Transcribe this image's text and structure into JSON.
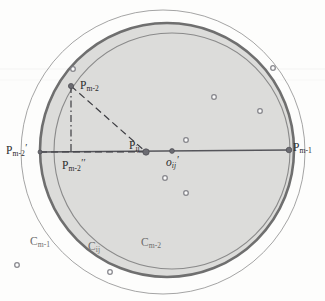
{
  "figure": {
    "background_color": "#fdfdfc",
    "shade_color": "#dcdcda",
    "line_color": "#8a8a8a",
    "thick_line_color": "#6f6f6f",
    "dot_color": "#7e7e84",
    "text_color": "#2b2b2b"
  },
  "labels": {
    "p_m2_top": {
      "base": "P",
      "sub": "m-2",
      "prime": ""
    },
    "p_m2_left": {
      "base": "P",
      "sub": "m-2",
      "prime": "′"
    },
    "p_m2_foot": {
      "base": "P",
      "sub": "m-2",
      "prime": "′′"
    },
    "p_ij": {
      "base": "P",
      "sub": "ij",
      "prime": ""
    },
    "p_m1_right": {
      "base": "P",
      "sub": "m-1",
      "prime": ""
    },
    "o_ij": {
      "base": "o",
      "sub": "ij",
      "prime": "′"
    },
    "c_m1": {
      "base": "C",
      "sub": "m-1",
      "prime": ""
    },
    "c_ij": {
      "base": "C",
      "sub": "ij",
      "prime": ""
    },
    "c_m2": {
      "base": "C",
      "sub": "m-2",
      "prime": ""
    }
  },
  "chart_data": {
    "type": "scatter",
    "xlabel": "",
    "ylabel": "",
    "xlim": [
      0,
      325
    ],
    "ylim": [
      0,
      301
    ],
    "grid": false,
    "legend_position": "none",
    "circles": [
      {
        "name": "C_m-1",
        "cx": 163,
        "cy": 152,
        "r": 142,
        "stroke": "#9a9a9a",
        "stroke_width": 0.9,
        "fill": "none"
      },
      {
        "name": "C_ij",
        "cx": 167,
        "cy": 150,
        "r": 127,
        "stroke": "#6f6f6f",
        "stroke_width": 2.6,
        "fill": "#dcdcda"
      },
      {
        "name": "C_m-2",
        "cx": 172,
        "cy": 151,
        "r": 118,
        "stroke": "#8a8a8a",
        "stroke_width": 1.1,
        "fill": "none"
      }
    ],
    "points": [
      {
        "name": "P_m-2",
        "x": 71,
        "y": 86,
        "r": 2.6
      },
      {
        "name": "P_ij",
        "x": 146,
        "y": 152,
        "r": 3.2
      },
      {
        "name": "o_ij'",
        "x": 172,
        "y": 151,
        "r": 2.4
      },
      {
        "name": "P_m-1",
        "x": 289,
        "y": 150,
        "r": 2.8
      },
      {
        "name": "P_m-2'",
        "x": 40,
        "y": 152,
        "r": 2.0
      },
      {
        "name": "P_m-2''",
        "x": 71,
        "y": 152,
        "r": 0
      }
    ],
    "scatter_dots": [
      {
        "x": 273,
        "y": 68
      },
      {
        "x": 73,
        "y": 69
      },
      {
        "x": 214,
        "y": 97
      },
      {
        "x": 260,
        "y": 111
      },
      {
        "x": 186,
        "y": 140
      },
      {
        "x": 165,
        "y": 178
      },
      {
        "x": 186,
        "y": 193
      },
      {
        "x": 17,
        "y": 265
      },
      {
        "x": 110,
        "y": 272
      }
    ],
    "segments": [
      {
        "name": "horizontal-axis",
        "x1": 40,
        "y1": 152,
        "x2": 289,
        "y2": 150,
        "style": "solid"
      },
      {
        "name": "radius-dashed-left",
        "x1": 40,
        "y1": 152,
        "x2": 146,
        "y2": 152,
        "style": "dashed"
      },
      {
        "name": "hypotenuse-dashed",
        "x1": 71,
        "y1": 86,
        "x2": 146,
        "y2": 152,
        "style": "dashed"
      },
      {
        "name": "vertical-dashdot",
        "x1": 71,
        "y1": 86,
        "x2": 71,
        "y2": 154,
        "style": "dashdot"
      }
    ]
  }
}
